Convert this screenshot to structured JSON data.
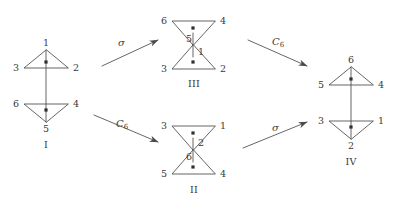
{
  "figure": {
    "type": "diagram",
    "stroke_color": "#4a4a4a",
    "text_color": "#3a3a3a",
    "background": "#ffffff"
  },
  "structures": [
    {
      "id": "I",
      "caption": "I",
      "shape": "two-triangles-vertical",
      "top_triangle": {
        "apex_position": "top",
        "apex": "1",
        "left": "3",
        "right": "2"
      },
      "bottom_triangle": {
        "apex_position": "bottom",
        "apex": "5",
        "left": "6",
        "right": "4"
      },
      "vertices": [
        "1",
        "2",
        "3",
        "4",
        "5",
        "6"
      ]
    },
    {
      "id": "III",
      "caption": "III",
      "shape": "hourglass",
      "top_triangle": {
        "apex_position": "bottom",
        "apex": "5",
        "left": "6",
        "right": "4"
      },
      "bottom_triangle": {
        "apex_position": "top",
        "apex": "1",
        "left": "3",
        "right": "2"
      },
      "vertices": [
        "6",
        "4",
        "5",
        "1",
        "3",
        "2"
      ]
    },
    {
      "id": "II",
      "caption": "II",
      "shape": "hourglass",
      "top_triangle": {
        "apex_position": "bottom",
        "apex": "2",
        "left": "3",
        "right": "1"
      },
      "bottom_triangle": {
        "apex_position": "top",
        "apex": "6",
        "left": "5",
        "right": "4"
      },
      "vertices": [
        "3",
        "1",
        "2",
        "6",
        "5",
        "4"
      ]
    },
    {
      "id": "IV",
      "caption": "IV",
      "shape": "two-triangles-vertical",
      "top_triangle": {
        "apex_position": "top",
        "apex": "6",
        "left": "5",
        "right": "4"
      },
      "bottom_triangle": {
        "apex_position": "bottom",
        "apex": "2",
        "left": "3",
        "right": "1"
      },
      "vertices": [
        "6",
        "5",
        "4",
        "3",
        "1",
        "2"
      ]
    }
  ],
  "arrows": [
    {
      "id": "arrow-top-left",
      "label": "σ",
      "label_sub": "",
      "from": "I",
      "to": "III"
    },
    {
      "id": "arrow-top-right",
      "label": "C",
      "label_sub": "6",
      "from": "III",
      "to": "IV"
    },
    {
      "id": "arrow-bottom-left",
      "label": "C",
      "label_sub": "6",
      "from": "I",
      "to": "II"
    },
    {
      "id": "arrow-bottom-right",
      "label": "σ",
      "label_sub": "",
      "from": "II",
      "to": "IV"
    }
  ],
  "labels": {
    "s1_apex_top": "1",
    "s1_right_top": "2",
    "s1_left_top": "3",
    "s1_right_bot": "4",
    "s1_apex_bot": "5",
    "s1_left_bot": "6",
    "s1_caption": "I",
    "s3_left_top": "6",
    "s3_right_top": "4",
    "s3_apex_top": "5",
    "s3_apex_bot": "1",
    "s3_left_bot": "3",
    "s3_right_bot": "2",
    "s3_caption": "III",
    "s2_left_top": "3",
    "s2_right_top": "1",
    "s2_apex_top": "2",
    "s2_apex_bot": "6",
    "s2_left_bot": "5",
    "s2_right_bot": "4",
    "s2_caption": "II",
    "s4_apex_top": "6",
    "s4_left_top": "5",
    "s4_right_top": "4",
    "s4_left_bot": "3",
    "s4_right_bot": "1",
    "s4_apex_bot": "2",
    "s4_caption": "IV",
    "arrow1_label": "σ",
    "arrow2_label": "C",
    "arrow2_sub": "6",
    "arrow3_label": "C",
    "arrow3_sub": "6",
    "arrow4_label": "σ"
  }
}
